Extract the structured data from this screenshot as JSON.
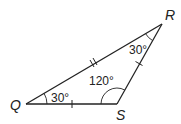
{
  "diagram": {
    "type": "triangle",
    "vertices": [
      {
        "label": "Q",
        "x": 26,
        "y": 104
      },
      {
        "label": "R",
        "x": 162,
        "y": 24
      },
      {
        "label": "S",
        "x": 117,
        "y": 104
      }
    ],
    "angles": [
      {
        "vertex": "Q",
        "label": "30°"
      },
      {
        "vertex": "R",
        "label": "30°"
      },
      {
        "vertex": "S",
        "label": "120°"
      }
    ],
    "tick_marks": [
      {
        "side": "QS",
        "count": 1
      },
      {
        "side": "SR",
        "count": 1
      },
      {
        "side": "QR",
        "count": 2
      }
    ],
    "colors": {
      "stroke": "#222222",
      "background": "#ffffff"
    }
  }
}
